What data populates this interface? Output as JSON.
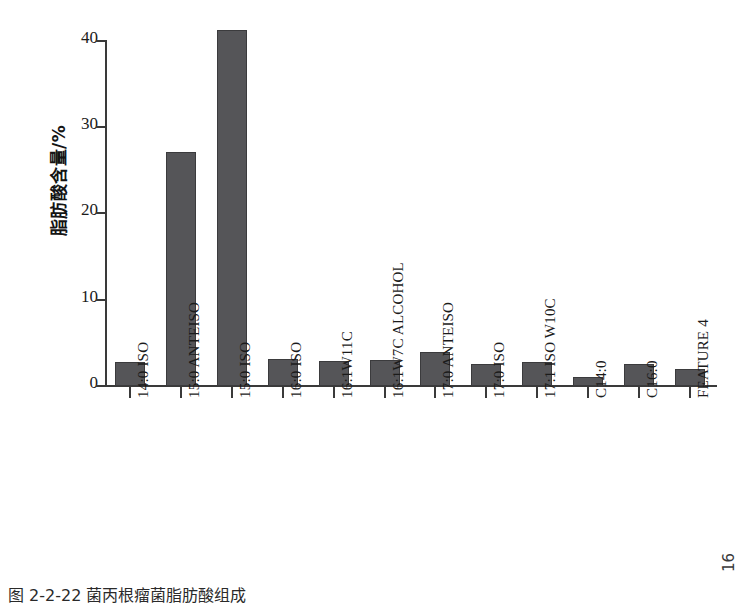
{
  "figure": {
    "caption": "图 2-2-22  菌丙根瘤菌脂肪酸组成",
    "page_number": "16"
  },
  "chart_data": {
    "type": "bar",
    "title": "",
    "xlabel": "",
    "ylabel": "脂肪酸含量/%",
    "ylim": [
      0,
      41.8
    ],
    "grid": false,
    "legend": "none",
    "yticks": [
      0,
      10,
      20,
      30,
      40
    ],
    "ytick_labels": [
      "0",
      "10",
      "20",
      "30",
      "40"
    ],
    "categories": [
      "14:0 ISO",
      "15:0 ANTEISO",
      "15:0 ISO",
      "16:0 ISO",
      "16:1W11C",
      "16:1W7C ALCOHOL",
      "17:0 ANTEISO",
      "17:0 ISO",
      "17:1 ISO W10C",
      "C14:0",
      "C16:0",
      "FEATURE 4"
    ],
    "values": [
      2.8,
      27.1,
      41.3,
      3.1,
      2.9,
      3.0,
      3.9,
      2.5,
      2.8,
      1.0,
      2.6,
      2.0
    ],
    "bar_color": "#555558",
    "bar_edge_color": "#3b3b3d",
    "axis_color": "#3a3a3a"
  }
}
